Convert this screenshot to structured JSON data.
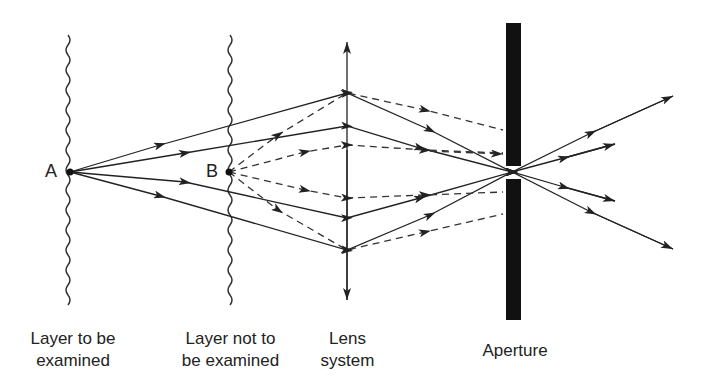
{
  "points": {
    "a": "A",
    "b": "B"
  },
  "labels": {
    "layer_examined": [
      "Layer to be",
      "examined"
    ],
    "layer_not_examined": [
      "Layer not to",
      "be examined"
    ],
    "lens": [
      "Lens",
      "system"
    ],
    "aperture": "Aperture"
  },
  "colors": {
    "line": "#222222",
    "aperture": "#111111",
    "background": "#ffffff"
  }
}
